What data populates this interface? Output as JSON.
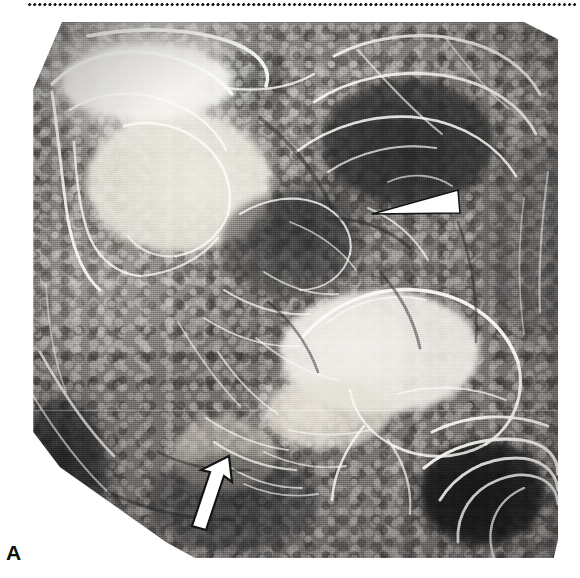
{
  "figure": {
    "panel_label": "A",
    "modality": "double-contrast barium radiograph",
    "region": "abdomen — small bowel / gastrointestinal tract",
    "orientation": "anteroposterior",
    "top_rule": {
      "style": "dotted",
      "color": "#1a1a1a",
      "dot_spacing_px": 5
    },
    "plate": {
      "x": 28,
      "y": 22,
      "width": 530,
      "height": 536,
      "corner_shape": "chamfered-octagonal-collimation",
      "background_color": "#7c7c7c",
      "highlight_color": "#f4f2ee",
      "shadow_color": "#1c1c1c",
      "has_scanline_artifact": true,
      "scanline_y": 410
    },
    "markers": [
      {
        "name": "arrowhead",
        "shape": "solid-triangle",
        "fill": "#ffffff",
        "outline": "#111111",
        "direction": "points-left",
        "tip_x": 372,
        "tip_y": 214,
        "base_x": 458,
        "base_top_y": 190,
        "base_bottom_y": 213,
        "indicates": "mucosal abnormality in bowel loop, upper right quadrant"
      },
      {
        "name": "arrow",
        "shape": "block-arrow",
        "fill": "#ffffff",
        "outline": "#111111",
        "direction": "points-up-right",
        "tip_x": 229,
        "tip_y": 456,
        "tail_x": 196,
        "tail_y": 530,
        "indicates": "nodular mucosal thickening, lower central field"
      }
    ],
    "features": [
      {
        "name": "barium-filled-loop-upper-left",
        "tone": "bright",
        "cx": 175,
        "cy": 180
      },
      {
        "name": "barium-filled-loop-right",
        "tone": "bright",
        "cx": 390,
        "cy": 345
      },
      {
        "name": "gas-filled-loops-upper-right",
        "tone": "dark",
        "cx": 410,
        "cy": 150
      },
      {
        "name": "gas-filled-loop-lower-right",
        "tone": "dark",
        "cx": 480,
        "cy": 495
      },
      {
        "name": "nodular-mucosal-pattern-center",
        "tone": "mixed",
        "cx": 300,
        "cy": 300
      }
    ]
  }
}
